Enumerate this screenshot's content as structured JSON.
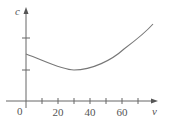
{
  "chart_data": {
    "type": "line",
    "title": "",
    "xlabel": "v",
    "ylabel": "c",
    "origin_label": "0",
    "x_ticks": [
      10,
      20,
      30,
      40,
      50,
      60,
      70
    ],
    "x_tick_labels": [
      {
        "value": 20,
        "label": "20"
      },
      {
        "value": 40,
        "label": "40"
      },
      {
        "value": 60,
        "label": "60"
      }
    ],
    "y_ticks_unlabeled": 2,
    "xlim": [
      0,
      82
    ],
    "grid": false,
    "series": [
      {
        "name": "c(v)",
        "x": [
          0,
          10,
          20,
          30,
          40,
          50,
          60,
          70,
          79
        ],
        "y_pixel": [
          54,
          60,
          66,
          70,
          66,
          59,
          50,
          38,
          24
        ]
      }
    ],
    "colors": {
      "axis": "#666666",
      "curve": "#777777",
      "text": "#555555"
    }
  }
}
